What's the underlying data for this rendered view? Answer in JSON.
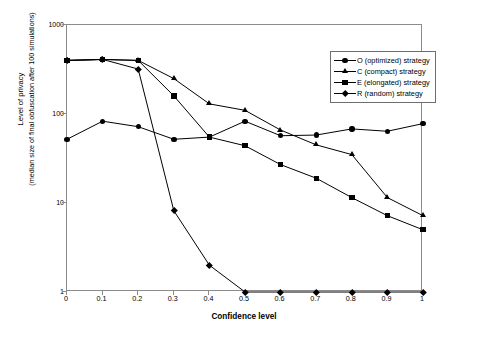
{
  "chart_data": {
    "type": "line",
    "title": "",
    "xlabel": "Confidence level",
    "ylabel_line1": "Level of privacy",
    "ylabel_line2": "(median size of final obfuscation after 100 simulations)",
    "yscale": "log",
    "ylim": [
      1,
      1000
    ],
    "xlim": [
      0,
      1
    ],
    "grid": false,
    "legend_position": "upper-right",
    "ytick_labels": [
      "1000",
      "100",
      "10",
      "1"
    ],
    "ytick_values": [
      1000,
      100,
      10,
      1
    ],
    "xtick_labels": [
      "0",
      "0.1",
      "0.2",
      "0.3",
      "0.4",
      "0.5",
      "0.6",
      "0.7",
      "0.8",
      "0.9",
      "1"
    ],
    "x": [
      0,
      0.1,
      0.2,
      0.3,
      0.4,
      0.5,
      0.6,
      0.7,
      0.8,
      0.9,
      1
    ],
    "series": [
      {
        "name": "O (optimized) strategy",
        "marker": "circle",
        "legend_label": "O (optimized) strategy",
        "values": [
          52,
          83,
          72,
          52,
          55,
          83,
          57,
          58,
          68,
          64,
          78
        ]
      },
      {
        "name": "C (compact) strategy",
        "marker": "triangle",
        "legend_label": "C (compact) strategy",
        "values": [
          400,
          410,
          400,
          250,
          130,
          110,
          66,
          45,
          35,
          11.5,
          7.2
        ]
      },
      {
        "name": "E (elongated) strategy",
        "marker": "square",
        "legend_label": "E (elongated) strategy",
        "values": [
          400,
          410,
          400,
          160,
          55,
          44,
          27,
          19,
          11.5,
          7.2,
          5
        ]
      },
      {
        "name": "R (random) strategy",
        "marker": "diamond",
        "legend_label": "R (random) strategy",
        "values": [
          400,
          410,
          320,
          8.2,
          2,
          1,
          1,
          1,
          1,
          1,
          1
        ]
      }
    ]
  }
}
